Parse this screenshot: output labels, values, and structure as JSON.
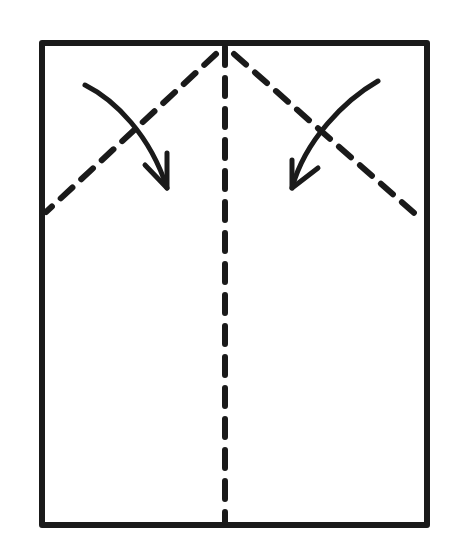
{
  "diagram": {
    "type": "origami-fold-instruction",
    "ink_color": "#1a1a1a",
    "background": "#ffffff",
    "paper": {
      "x": 42,
      "y": 43,
      "width": 385,
      "height": 482
    },
    "folds": [
      {
        "name": "center-valley-fold",
        "style": "dashed",
        "from": [
          225,
          45
        ],
        "to": [
          225,
          525
        ]
      },
      {
        "name": "left-diagonal-fold",
        "style": "dashed",
        "from": [
          222,
          48
        ],
        "to": [
          44,
          213
        ]
      },
      {
        "name": "right-diagonal-fold",
        "style": "dashed",
        "from": [
          230,
          48
        ],
        "to": [
          424,
          222
        ]
      }
    ],
    "arrows": [
      {
        "name": "left-fold-arrow",
        "direction": "fold top-left corner down toward center"
      },
      {
        "name": "right-fold-arrow",
        "direction": "fold top-right corner down toward center"
      }
    ]
  }
}
